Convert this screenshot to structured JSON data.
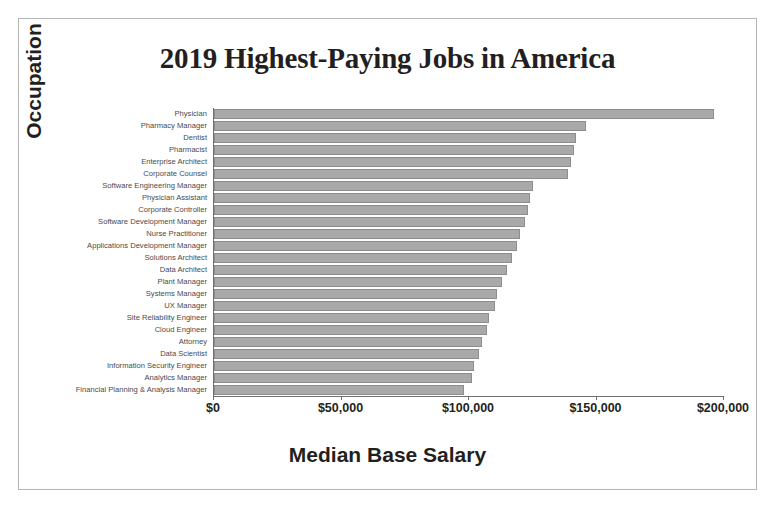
{
  "chart_data": {
    "type": "bar",
    "orientation": "horizontal",
    "title": "2019 Highest-Paying Jobs in America",
    "xlabel": "Median Base Salary",
    "ylabel": "Occupation",
    "xlim": [
      0,
      200000
    ],
    "xticks": [
      0,
      50000,
      100000,
      150000,
      200000
    ],
    "xtick_labels": [
      "$0",
      "$50,000",
      "$100,000",
      "$150,000",
      "$200,000"
    ],
    "grid": false,
    "legend": false,
    "bar_color": "#a9a9a9",
    "bar_edge_color": "#8d8d8d",
    "categories": [
      "Physician",
      "Pharmacy Manager",
      "Dentist",
      "Pharmacist",
      "Enterprise Architect",
      "Corporate Counsel",
      "Software Engineering Manager",
      "Physician Assistant",
      "Corporate Controller",
      "Software Development Manager",
      "Nurse Practitioner",
      "Applications Development Manager",
      "Solutions Architect",
      "Data Architect",
      "Plant Manager",
      "Systems Manager",
      "UX Manager",
      "Site Reliability Engineer",
      "Cloud Engineer",
      "Attorney",
      "Data Scientist",
      "Information Security Engineer",
      "Analytics Manager",
      "Financial Planning & Analysis Manager"
    ],
    "values": [
      196000,
      146000,
      142000,
      141000,
      140000,
      139000,
      125000,
      124000,
      123000,
      122000,
      120000,
      119000,
      117000,
      115000,
      113000,
      111000,
      110000,
      108000,
      107000,
      105000,
      104000,
      102000,
      101000,
      98000
    ]
  },
  "figure": {
    "background_color": "#ffffff",
    "frame_color": "#b4b4b4",
    "axis_color": "#6f6f6f",
    "text_color": "#231f20"
  }
}
